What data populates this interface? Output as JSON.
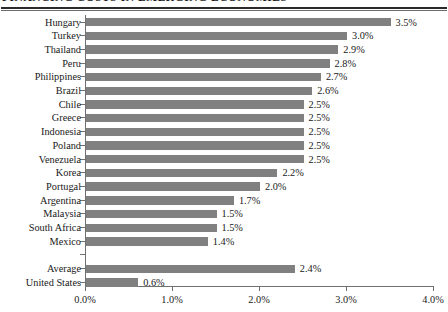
{
  "document": {
    "title": "FINANCING COSTS IN EMERGING ECONOMIES",
    "title_clipped": true
  },
  "chart_data": {
    "type": "bar",
    "orientation": "horizontal",
    "title": "FINANCING COSTS IN EMERGING ECONOMIES",
    "xlabel": "",
    "ylabel": "",
    "xlim": [
      0.0,
      4.0
    ],
    "xticks": [
      0.0,
      1.0,
      2.0,
      3.0,
      4.0
    ],
    "xtick_labels": [
      "0.0%",
      "1.0%",
      "2.0%",
      "3.0%",
      "4.0%"
    ],
    "grid": false,
    "legend": null,
    "bar_color": "#808080",
    "axis_color": "#707070",
    "value_label_suffix": "%",
    "categories": [
      "Hungary",
      "Turkey",
      "Thailand",
      "Peru",
      "Philippines",
      "Brazil",
      "Chile",
      "Greece",
      "Indonesia",
      "Poland",
      "Venezuela",
      "Korea",
      "Portugal",
      "Argentina",
      "Malaysia",
      "South Africa",
      "Mexico",
      "",
      "Average",
      "United States"
    ],
    "values": [
      3.5,
      3.0,
      2.9,
      2.8,
      2.7,
      2.6,
      2.5,
      2.5,
      2.5,
      2.5,
      2.5,
      2.2,
      2.0,
      1.7,
      1.5,
      1.5,
      1.4,
      null,
      2.4,
      0.6
    ],
    "value_labels": [
      "3.5%",
      "3.0%",
      "2.9%",
      "2.8%",
      "2.7%",
      "2.6%",
      "2.5%",
      "2.5%",
      "2.5%",
      "2.5%",
      "2.5%",
      "2.2%",
      "2.0%",
      "1.7%",
      "1.5%",
      "1.5%",
      "1.4%",
      "",
      "2.4%",
      "0.6%"
    ],
    "rows": [
      {
        "label": "Hungary",
        "value": 3.5,
        "value_label": "3.5%",
        "spacer": false
      },
      {
        "label": "Turkey",
        "value": 3.0,
        "value_label": "3.0%",
        "spacer": false
      },
      {
        "label": "Thailand",
        "value": 2.9,
        "value_label": "2.9%",
        "spacer": false
      },
      {
        "label": "Peru",
        "value": 2.8,
        "value_label": "2.8%",
        "spacer": false
      },
      {
        "label": "Philippines",
        "value": 2.7,
        "value_label": "2.7%",
        "spacer": false
      },
      {
        "label": "Brazil",
        "value": 2.6,
        "value_label": "2.6%",
        "spacer": false
      },
      {
        "label": "Chile",
        "value": 2.5,
        "value_label": "2.5%",
        "spacer": false
      },
      {
        "label": "Greece",
        "value": 2.5,
        "value_label": "2.5%",
        "spacer": false
      },
      {
        "label": "Indonesia",
        "value": 2.5,
        "value_label": "2.5%",
        "spacer": false
      },
      {
        "label": "Poland",
        "value": 2.5,
        "value_label": "2.5%",
        "spacer": false
      },
      {
        "label": "Venezuela",
        "value": 2.5,
        "value_label": "2.5%",
        "spacer": false
      },
      {
        "label": "Korea",
        "value": 2.2,
        "value_label": "2.2%",
        "spacer": false
      },
      {
        "label": "Portugal",
        "value": 2.0,
        "value_label": "2.0%",
        "spacer": false
      },
      {
        "label": "Argentina",
        "value": 1.7,
        "value_label": "1.7%",
        "spacer": false
      },
      {
        "label": "Malaysia",
        "value": 1.5,
        "value_label": "1.5%",
        "spacer": false
      },
      {
        "label": "South Africa",
        "value": 1.5,
        "value_label": "1.5%",
        "spacer": false
      },
      {
        "label": "Mexico",
        "value": 1.4,
        "value_label": "1.4%",
        "spacer": false
      },
      {
        "label": "",
        "value": null,
        "value_label": "",
        "spacer": true
      },
      {
        "label": "Average",
        "value": 2.4,
        "value_label": "2.4%",
        "spacer": false
      },
      {
        "label": "United States",
        "value": 0.6,
        "value_label": "0.6%",
        "spacer": false
      }
    ]
  }
}
